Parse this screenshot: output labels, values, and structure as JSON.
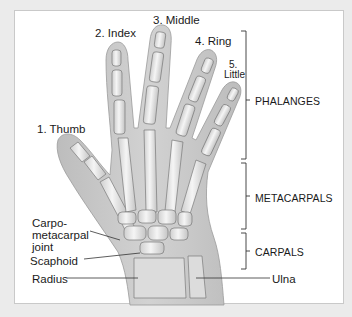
{
  "diagram": {
    "fingers": [
      {
        "label": "1. Thumb"
      },
      {
        "label": "2. Index"
      },
      {
        "label": "3. Middle"
      },
      {
        "label": "4. Ring"
      },
      {
        "label_line1": "5.",
        "label_line2": "Little"
      }
    ],
    "regions": [
      {
        "label": "PHALANGES"
      },
      {
        "label": "METACARPALS"
      },
      {
        "label": "CARPALS"
      }
    ],
    "callouts": {
      "cmc_line1": "Carpo-",
      "cmc_line2": "metacarpal",
      "cmc_line3": "joint",
      "scaphoid": "Scaphoid",
      "radius": "Radius",
      "ulna": "Ulna"
    },
    "colors": {
      "background": "#ebebeb",
      "panel": "#ffffff",
      "skin": "#c9c9c9",
      "bone": "#efefef",
      "line": "#333333"
    }
  }
}
